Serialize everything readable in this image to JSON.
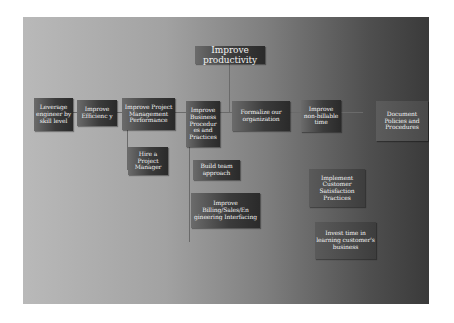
{
  "diagram": {
    "root": {
      "label": "Improve productivity"
    },
    "level1": [
      {
        "id": "leverage",
        "label": "Leverage engineer by skill level"
      },
      {
        "id": "efficiency",
        "label": "Improve Efficienc y"
      },
      {
        "id": "pm-performance",
        "label": "Improve Project Management Performance"
      },
      {
        "id": "business-procedures",
        "label": "Improve Business Procedur es and Practices"
      },
      {
        "id": "formalize",
        "label": "Formalize our organization"
      },
      {
        "id": "non-billable",
        "label": "Improve non-billable time"
      },
      {
        "id": "document-policies",
        "label": "Document Policies and Procedures"
      }
    ],
    "level2": [
      {
        "id": "hire-pm",
        "parent": "pm-performance",
        "label": "Hire a Project Manager"
      },
      {
        "id": "team-approach",
        "parent": "business-procedures",
        "label": "Build team approach"
      },
      {
        "id": "billing-interfacing",
        "parent": "business-procedures",
        "label": "Improve Billing/Sales/En gineering Interfacing"
      },
      {
        "id": "customer-satisfaction",
        "parent": "non-billable",
        "label": "Implement Customer Satisfaction Practices"
      },
      {
        "id": "learn-business",
        "parent": "non-billable",
        "label": "Invest time in learning customer's business"
      }
    ]
  },
  "colors": {
    "background_light": "#b9b9b9",
    "background_dark": "#3a3a3a",
    "node_fill": "#3b3b3b",
    "node_text": "#f2f2f2",
    "connector": "#6a6a6a"
  }
}
